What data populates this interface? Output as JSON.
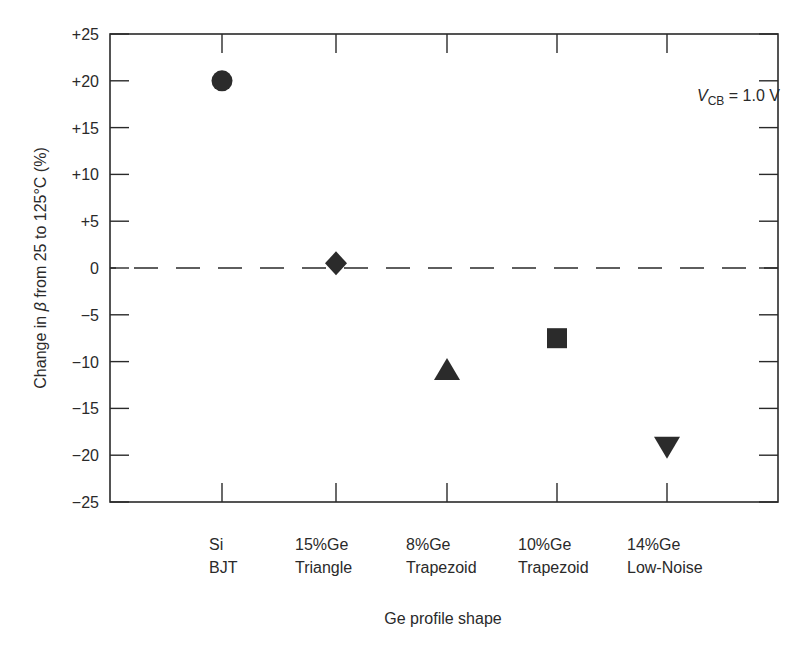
{
  "chart_data": {
    "type": "scatter",
    "title": "",
    "xlabel": "Ge profile shape",
    "ylabel_parts": {
      "pre": "Change in ",
      "symbol": "β",
      "post": " from 25 to 125°C (%)"
    },
    "ylabel": "Change in β from 25 to 125°C (%)",
    "ylim": [
      -25,
      25
    ],
    "yticks": [
      25,
      20,
      15,
      10,
      5,
      0,
      -5,
      -10,
      -15,
      -20,
      -25
    ],
    "ytick_labels": [
      "+25",
      "+20",
      "+15",
      "+10",
      "+5",
      "0",
      "−5",
      "−10",
      "−15",
      "−20",
      "−25"
    ],
    "grid": false,
    "reference_line": {
      "y": 0,
      "style": "dashed"
    },
    "annotation": {
      "var": "V",
      "sub": "CB",
      "text": " = 1.0 V"
    },
    "categories": [
      {
        "line1": "Si",
        "line2": "BJT"
      },
      {
        "line1": "15%Ge",
        "line2": "Triangle"
      },
      {
        "line1": "8%Ge",
        "line2": "Trapezoid"
      },
      {
        "line1": "10%Ge",
        "line2": "Trapezoid"
      },
      {
        "line1": "14%Ge",
        "line2": "Low-Noise"
      }
    ],
    "points": [
      {
        "category": "Si BJT",
        "value": 20,
        "marker": "circle"
      },
      {
        "category": "15%Ge Triangle",
        "value": 0.5,
        "marker": "diamond"
      },
      {
        "category": "8%Ge Trapezoid",
        "value": -11,
        "marker": "triangle-up"
      },
      {
        "category": "10%Ge Trapezoid",
        "value": -7.5,
        "marker": "square"
      },
      {
        "category": "14%Ge Low-Noise",
        "value": -19,
        "marker": "triangle-down"
      }
    ],
    "marker_color": "#2b2b2b"
  }
}
